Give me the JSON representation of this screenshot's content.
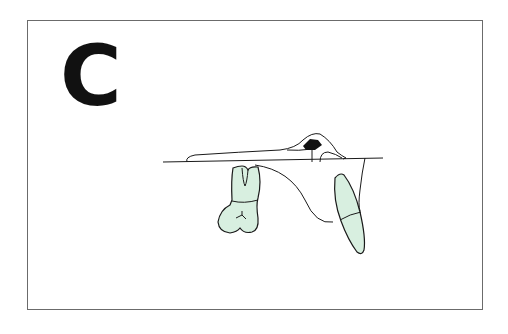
{
  "figure": {
    "panel_label": "C",
    "colors": {
      "frame": "#6b6b6b",
      "line": "#1a1a1a",
      "tooth_fill": "#d8efe0",
      "marker": "#111111"
    }
  }
}
